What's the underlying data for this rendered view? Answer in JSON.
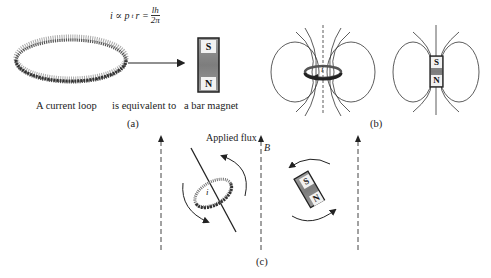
{
  "figure": {
    "panel_a": {
      "formula": {
        "lhs": "i ∝ p",
        "subscript": "t",
        "mid": "r =",
        "numerator": "lh",
        "denominator": "2π"
      },
      "labels": {
        "loop": "A current loop",
        "equivalent": "is equivalent to",
        "magnet": "a bar magnet"
      },
      "magnet_poles": {
        "top": "S",
        "bottom": "N"
      },
      "caption": "(a)"
    },
    "panel_b": {
      "loop_current": "i",
      "magnet_poles": {
        "top": "S",
        "bottom": "N"
      },
      "caption": "(b)"
    },
    "panel_c": {
      "applied_flux_label": "Applied flux",
      "field_symbol": "B",
      "loop_current": "i",
      "magnet_poles": {
        "top": "S",
        "bottom": "N"
      },
      "caption": "(c)"
    },
    "colors": {
      "ink": "#222222",
      "magnet_fill": "#8a8a8a",
      "magnet_border": "#222222",
      "loop_ink": "#555555"
    }
  }
}
